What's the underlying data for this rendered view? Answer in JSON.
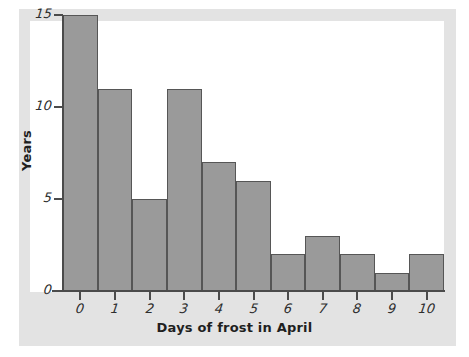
{
  "chart_data": {
    "type": "bar",
    "title": "",
    "subtitle": "",
    "xlabel": "Days of frost in April",
    "ylabel": "Years",
    "categories": [
      "0",
      "1",
      "2",
      "3",
      "4",
      "5",
      "6",
      "7",
      "8",
      "9",
      "10"
    ],
    "values": [
      15,
      11,
      5,
      11,
      7,
      6,
      2,
      3,
      2,
      1,
      2
    ],
    "xlim": [
      -0.5,
      10.5
    ],
    "ylim": [
      0,
      15
    ],
    "x_ticks": [
      "0",
      "1",
      "2",
      "3",
      "4",
      "5",
      "6",
      "7",
      "8",
      "9",
      "10"
    ],
    "y_ticks": [
      "0",
      "5",
      "10",
      "15"
    ],
    "grid": false,
    "legend": null,
    "annotations": [],
    "bar_fill_color": "#9a9a9a",
    "bar_edge_color": "#565656",
    "axis_color": "#4b4b4b",
    "plot_background": "#ffffff",
    "figure_background": "#e3e3e3"
  }
}
